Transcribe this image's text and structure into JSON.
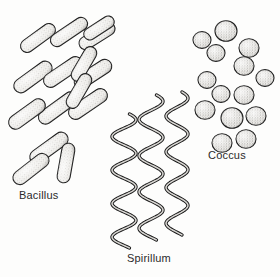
{
  "figure": {
    "kind": "scientific-line-illustration",
    "background_color": "#fdfdfc",
    "ink_color": "#1a1a1a",
    "fill_color": "#f2f1ee",
    "stipple_color": "#7d7b77",
    "width": 280,
    "height": 277
  },
  "groups": [
    {
      "id": "bacillus",
      "label": "Bacillus",
      "shape": "rod",
      "label_x": 19,
      "label_y": 190,
      "count": 15
    },
    {
      "id": "spirillum",
      "label": "Spirillum",
      "shape": "spiral",
      "label_x": 127,
      "label_y": 253,
      "count": 3
    },
    {
      "id": "coccus",
      "label": "Coccus",
      "shape": "sphere",
      "label_x": 208,
      "label_y": 150,
      "count": 15
    }
  ],
  "bacillus_rods": [
    {
      "cx": 38,
      "cy": 38,
      "len": 40,
      "w": 13,
      "angle": -36
    },
    {
      "cx": 69,
      "cy": 32,
      "len": 42,
      "w": 13,
      "angle": -34
    },
    {
      "cx": 97,
      "cy": 36,
      "len": 40,
      "w": 13,
      "angle": -32
    },
    {
      "cx": 33,
      "cy": 77,
      "len": 44,
      "w": 14,
      "angle": -36
    },
    {
      "cx": 63,
      "cy": 72,
      "len": 44,
      "w": 14,
      "angle": -34
    },
    {
      "cx": 93,
      "cy": 74,
      "len": 42,
      "w": 14,
      "angle": -33
    },
    {
      "cx": 58,
      "cy": 108,
      "len": 45,
      "w": 14,
      "angle": -36
    },
    {
      "cx": 88,
      "cy": 104,
      "len": 44,
      "w": 14,
      "angle": -34
    },
    {
      "cx": 27,
      "cy": 114,
      "len": 42,
      "w": 14,
      "angle": -36
    },
    {
      "cx": 49,
      "cy": 148,
      "len": 44,
      "w": 14,
      "angle": -36
    },
    {
      "cx": 31,
      "cy": 169,
      "len": 42,
      "w": 14,
      "angle": -38
    },
    {
      "cx": 99,
      "cy": 28,
      "len": 34,
      "w": 12,
      "angle": -33
    },
    {
      "cx": 84,
      "cy": 64,
      "len": 38,
      "w": 13,
      "angle": -60
    },
    {
      "cx": 79,
      "cy": 91,
      "len": 38,
      "w": 13,
      "angle": -60
    },
    {
      "cx": 66,
      "cy": 163,
      "len": 40,
      "w": 13,
      "angle": -80
    }
  ],
  "spirillum_filaments": [
    {
      "x": 124,
      "top": 114,
      "bottom": 248,
      "amp": 12,
      "waves": 4
    },
    {
      "x": 151,
      "top": 95,
      "bottom": 240,
      "amp": 12,
      "waves": 4
    },
    {
      "x": 177,
      "top": 92,
      "bottom": 235,
      "amp": 11,
      "waves": 4
    }
  ],
  "coccus_cells": [
    {
      "cx": 202,
      "cy": 40,
      "r": 9
    },
    {
      "cx": 226,
      "cy": 31,
      "r": 11
    },
    {
      "cx": 216,
      "cy": 53,
      "r": 9
    },
    {
      "cx": 249,
      "cy": 48,
      "r": 10
    },
    {
      "cx": 244,
      "cy": 66,
      "r": 10
    },
    {
      "cx": 265,
      "cy": 78,
      "r": 9
    },
    {
      "cx": 207,
      "cy": 80,
      "r": 9
    },
    {
      "cx": 221,
      "cy": 94,
      "r": 9
    },
    {
      "cx": 244,
      "cy": 95,
      "r": 10
    },
    {
      "cx": 205,
      "cy": 110,
      "r": 10
    },
    {
      "cx": 232,
      "cy": 118,
      "r": 11
    },
    {
      "cx": 256,
      "cy": 116,
      "r": 10
    },
    {
      "cx": 222,
      "cy": 143,
      "r": 10
    },
    {
      "cx": 246,
      "cy": 139,
      "r": 10
    },
    {
      "cx": 186,
      "cy": 58,
      "r": 0
    }
  ]
}
